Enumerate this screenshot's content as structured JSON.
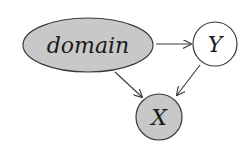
{
  "diagram": {
    "type": "bayesian-network",
    "nodes": [
      {
        "id": "domain",
        "label": "domain",
        "shape": "ellipse",
        "observed": true
      },
      {
        "id": "Y",
        "label": "Y",
        "shape": "circle",
        "observed": false
      },
      {
        "id": "X",
        "label": "X",
        "shape": "circle",
        "observed": true
      }
    ],
    "edges": [
      {
        "from": "domain",
        "to": "Y"
      },
      {
        "from": "domain",
        "to": "X"
      },
      {
        "from": "Y",
        "to": "X"
      }
    ],
    "colors": {
      "observed_fill": "#c8c8c8",
      "unobserved_fill": "#ffffff",
      "stroke": "#3a3a3a"
    }
  }
}
